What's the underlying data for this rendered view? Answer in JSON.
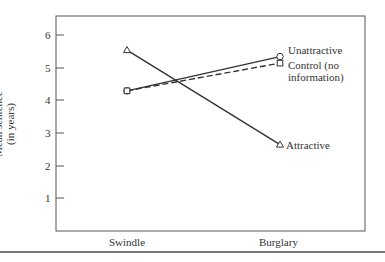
{
  "chart_data": {
    "type": "line",
    "title": "",
    "xlabel": "",
    "ylabel": "Mean sentence (in years)",
    "ylabel_lines": [
      "Mean sentence",
      "(in years)"
    ],
    "categories": [
      "Swindle",
      "Burglary"
    ],
    "yticks": [
      1,
      2,
      3,
      4,
      5,
      6
    ],
    "ylim": [
      0,
      6.6
    ],
    "grid": false,
    "legend_position": "inline-right",
    "series": [
      {
        "name": "Unattractive",
        "values": [
          4.3,
          5.35
        ],
        "marker": "circle",
        "line": "solid"
      },
      {
        "name": "Control (no information)",
        "values": [
          4.3,
          5.15
        ],
        "marker": "square",
        "line": "dashed"
      },
      {
        "name": "Attractive",
        "values": [
          5.55,
          2.65
        ],
        "marker": "triangle",
        "line": "solid"
      }
    ]
  },
  "labels": {
    "unattractive": "Unattractive",
    "control_line1": "Control (no",
    "control_line2": "information)",
    "attractive": "Attractive",
    "ylabel_line1": "Mean sentence",
    "ylabel_line2": "(in years)",
    "x_swindle": "Swindle",
    "x_burglary": "Burglary",
    "tick_1": "1",
    "tick_2": "2",
    "tick_3": "3",
    "tick_4": "4",
    "tick_5": "5",
    "tick_6": "6"
  }
}
